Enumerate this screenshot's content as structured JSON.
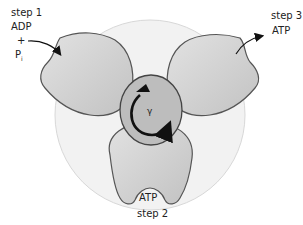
{
  "diagram": {
    "type": "ATP synthase rotary mechanism",
    "center_subunit": {
      "label": "γ",
      "rotation": "clockwise"
    },
    "steps": [
      {
        "name": "step 1",
        "substrates": [
          "ADP",
          "+",
          "Pi"
        ]
      },
      {
        "name": "step 2",
        "bound": "ATP"
      },
      {
        "name": "step 3",
        "product": "ATP"
      }
    ]
  },
  "labels": {
    "step1": "step 1",
    "adp": "ADP",
    "plus": "+",
    "p": "P",
    "p_sub": "i",
    "step3": "step 3",
    "atp_out": "ATP",
    "atp_bound": "ATP",
    "step2": "step 2",
    "gamma": "γ"
  },
  "colors": {
    "outer_ring": "#f0f0f0",
    "subunit_fill": "#cccccc",
    "gamma_fill": "#b8b8b8",
    "outline": "#555555",
    "arrow": "#111111"
  }
}
